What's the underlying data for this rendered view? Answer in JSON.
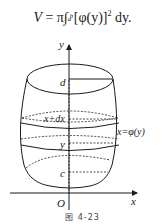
{
  "formula": {
    "lhs": "V",
    "eq": "=",
    "pi": "π",
    "integral": "∫",
    "upper": "b",
    "lower": "a",
    "integrand": "[φ(y)]",
    "power": "2",
    "differential": "dy."
  },
  "figure": {
    "axis_y_label": "y",
    "axis_x_label": "x",
    "origin_label": "O",
    "label_d": "d",
    "label_x_dx": "x+dx",
    "label_y": "y",
    "label_c": "c",
    "curve_label": "x=φ(y)",
    "caption": "图 4-23"
  },
  "colors": {
    "ink": "#1a1a1a",
    "background": "#ffffff"
  }
}
